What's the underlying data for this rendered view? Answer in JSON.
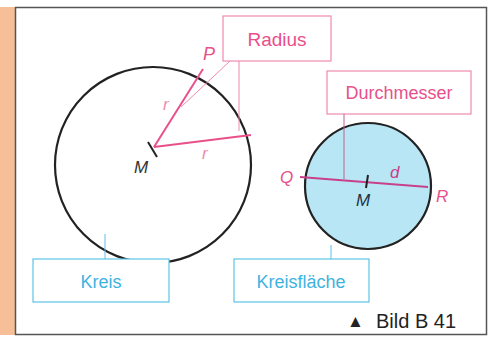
{
  "figure": {
    "caption": "Bild B 41",
    "caption_marker": "▲"
  },
  "colors": {
    "accent_bar": "#f7bf98",
    "frame": "#555555",
    "pink": "#e8508a",
    "pink_box": "#ef8ab0",
    "blue_box": "#5cc3e6",
    "blue_text": "#3fb3e0",
    "fill_blue": "#b9e6f5",
    "circle": "#222222"
  },
  "left_circle": {
    "center_label": "M",
    "point_label": "P",
    "radius_labels": [
      "r",
      "r"
    ],
    "box_label": "Kreis"
  },
  "right_circle": {
    "center_label": "M",
    "left_point_label": "Q",
    "right_point_label": "R",
    "diameter_label": "d",
    "box_label": "Kreisfläche"
  },
  "callouts": {
    "radius": "Radius",
    "diameter": "Durchmesser"
  }
}
